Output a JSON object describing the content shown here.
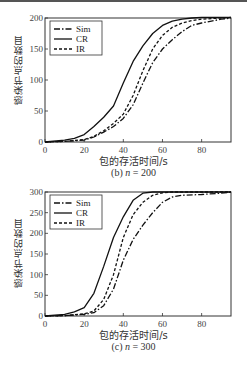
{
  "chart_data": [
    {
      "type": "line",
      "title": "",
      "caption": "(b) n = 200",
      "caption_prefix": "(b) ",
      "caption_var": "n",
      "caption_suffix": " = 200",
      "xlabel": "包的存活时间/s",
      "ylabel": "感染节点的数目",
      "xlim": [
        0,
        95
      ],
      "ylim": [
        0,
        200
      ],
      "xticks": [
        0,
        20,
        40,
        60,
        80
      ],
      "yticks": [
        0,
        50,
        100,
        150,
        200
      ],
      "grid": false,
      "legend_position": "upper left",
      "series": [
        {
          "name": "Sim",
          "style": "dash-dot",
          "x": [
            0,
            10,
            20,
            25,
            30,
            35,
            40,
            45,
            50,
            55,
            60,
            65,
            70,
            75,
            80,
            85,
            90,
            95
          ],
          "y": [
            0,
            1,
            3,
            8,
            16,
            25,
            38,
            60,
            95,
            128,
            150,
            165,
            178,
            188,
            192,
            195,
            198,
            200
          ]
        },
        {
          "name": "CR",
          "style": "solid",
          "x": [
            0,
            10,
            15,
            20,
            25,
            30,
            35,
            40,
            45,
            50,
            55,
            60,
            65,
            70,
            75,
            80,
            85,
            90,
            95
          ],
          "y": [
            0,
            3,
            6,
            12,
            25,
            40,
            58,
            95,
            130,
            155,
            175,
            188,
            195,
            198,
            200,
            201,
            201,
            201,
            201
          ]
        },
        {
          "name": "IR",
          "style": "dashed",
          "x": [
            0,
            10,
            20,
            25,
            30,
            35,
            40,
            45,
            50,
            55,
            60,
            65,
            70,
            75,
            80,
            85,
            90,
            95
          ],
          "y": [
            0,
            1,
            4,
            9,
            18,
            30,
            45,
            75,
            115,
            150,
            172,
            185,
            192,
            196,
            198,
            199,
            200,
            201
          ]
        }
      ]
    },
    {
      "type": "line",
      "title": "",
      "caption": "(c) n = 300",
      "caption_prefix": "(c) ",
      "caption_var": "n",
      "caption_suffix": " = 300",
      "xlabel": "包的存活时间/s",
      "ylabel": "感染节点的数目",
      "xlim": [
        0,
        95
      ],
      "ylim": [
        0,
        300
      ],
      "xticks": [
        0,
        20,
        40,
        60,
        80
      ],
      "yticks": [
        0,
        50,
        100,
        150,
        200,
        250,
        300
      ],
      "grid": false,
      "legend_position": "upper left",
      "series": [
        {
          "name": "Sim",
          "style": "dash-dot",
          "x": [
            0,
            10,
            20,
            25,
            30,
            35,
            40,
            45,
            50,
            55,
            60,
            65,
            70,
            80,
            90,
            95
          ],
          "y": [
            0,
            1,
            4,
            8,
            25,
            65,
            135,
            185,
            220,
            250,
            275,
            288,
            292,
            294,
            297,
            300
          ]
        },
        {
          "name": "CR",
          "style": "solid",
          "x": [
            0,
            10,
            15,
            20,
            25,
            30,
            35,
            40,
            45,
            50,
            55,
            60,
            70,
            80,
            95
          ],
          "y": [
            0,
            4,
            10,
            20,
            55,
            120,
            190,
            240,
            280,
            297,
            300,
            300,
            300,
            300,
            300
          ]
        },
        {
          "name": "IR",
          "style": "dashed",
          "x": [
            0,
            10,
            20,
            25,
            30,
            35,
            40,
            45,
            50,
            55,
            60,
            65,
            70,
            80,
            95
          ],
          "y": [
            0,
            1,
            5,
            12,
            40,
            100,
            190,
            245,
            275,
            292,
            298,
            300,
            300,
            300,
            300
          ]
        }
      ]
    }
  ],
  "legend": {
    "sim": "Sim",
    "cr": "CR",
    "ir": "IR"
  }
}
